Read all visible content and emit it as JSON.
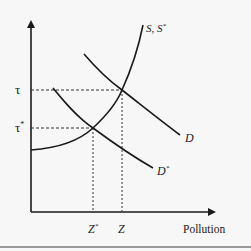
{
  "diagram": {
    "type": "supply-demand economics diagram",
    "axes": {
      "x_label": "Pollution",
      "y_label": ""
    },
    "y_ticks": [
      {
        "label": "τ",
        "y": 90
      },
      {
        "label": "τ*",
        "y": 128
      }
    ],
    "x_ticks": [
      {
        "label": "Z*",
        "x": 93
      },
      {
        "label": "Z",
        "x": 122
      }
    ],
    "curves": [
      {
        "id": "supply",
        "label": "S, S*",
        "shape": "upward-sloping convex"
      },
      {
        "id": "demand",
        "label": "D",
        "shape": "downward-sloping"
      },
      {
        "id": "demand_star",
        "label": "D*",
        "shape": "downward-sloping"
      }
    ],
    "equilibria": [
      {
        "name": "original",
        "intersects": [
          "S, S*",
          "D"
        ],
        "price": "τ",
        "quantity": "Z"
      },
      {
        "name": "new",
        "intersects": [
          "S, S*",
          "D*"
        ],
        "price": "τ*",
        "quantity": "Z*"
      }
    ],
    "colors": {
      "line": "#1a1a1a",
      "background": "#f7f7f7",
      "rule": "#9a9a9a"
    }
  },
  "labels": {
    "tau": "τ",
    "tau_star_base": "τ",
    "tau_star_sup": "*",
    "z_star_base": "Z",
    "z_star_sup": "*",
    "z": "Z",
    "s_curve": "S, S",
    "s_curve_sup": "*",
    "d_curve": "D",
    "d_star_base": "D",
    "d_star_sup": "*",
    "x_axis": "Pollution"
  }
}
